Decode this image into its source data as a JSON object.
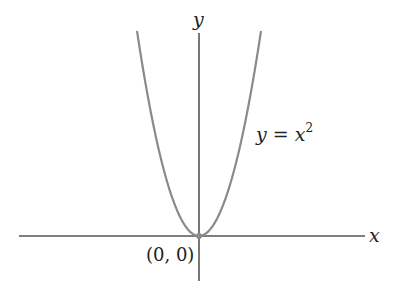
{
  "chart_data": {
    "type": "line",
    "title": "",
    "xlabel": "x",
    "ylabel": "y",
    "series": [
      {
        "name": "y = x^2",
        "label_base": "y = x",
        "label_exp": "2",
        "x": [
          -1.5,
          -1.25,
          -1,
          -0.75,
          -0.5,
          -0.25,
          0,
          0.25,
          0.5,
          0.75,
          1,
          1.25,
          1.5
        ],
        "y": [
          2.25,
          1.5625,
          1,
          0.5625,
          0.25,
          0.0625,
          0,
          0.0625,
          0.25,
          0.5625,
          1,
          1.5625,
          2.25
        ]
      }
    ],
    "annotations": [
      {
        "text": "(0, 0)",
        "x": 0,
        "y": 0,
        "marker": "point"
      }
    ],
    "grid": false,
    "legend": "none",
    "colors": {
      "axis": "#555555",
      "curve": "#8a8a8a",
      "text": "#222222"
    }
  }
}
